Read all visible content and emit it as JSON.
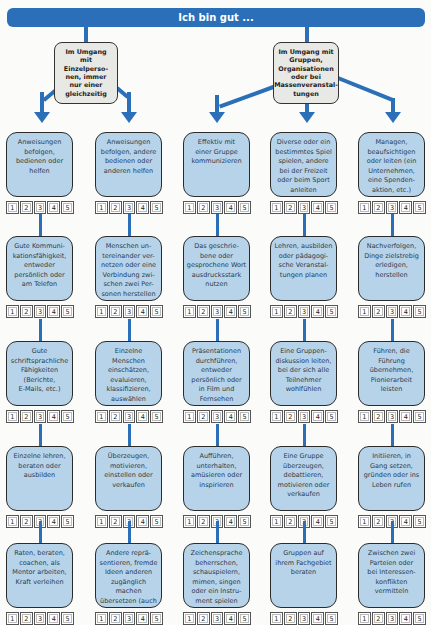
{
  "header": {
    "title": "Ich bin gut ..."
  },
  "groups": [
    {
      "label": "Im Umgang\nmit\nEinzelperso-\nnen, immer\nnur einer\ngleichzeitig"
    },
    {
      "label": "Im Umgang mit\nGruppen,\nOrganisationen\noder bei\nMassenveranstal-\ntungen"
    }
  ],
  "rating_scale": [
    "1",
    "2",
    "3",
    "4",
    "5"
  ],
  "colors": {
    "accent": "#2a6fb8",
    "box_fill": "#b7d3ea",
    "group_fill": "#e8e8e4"
  },
  "columns": [
    {
      "items": [
        "Anweisungen\nbefolgen,\nbedienen oder\nhelfen",
        "Gute Kommuni-\nkationsfähigkeit,\nentweder\npersönlich oder\nam Telefon",
        "Gute\nschriftsprachliche\nFähigkeiten\n(Berichte,\nE-Mails, etc.)",
        "Einzelne lehren,\nberaten oder\nausbilden",
        "Raten, beraten,\ncoachen, als\nMentor arbeiten,\nKraft verleihen"
      ]
    },
    {
      "items": [
        "Anweisungen\nbefolgen, andere\nbedienen oder\nanderen helfen",
        "Menschen un-\ntereinander ver-\nnetzen oder eine\nVerbindung zwi-\nschen zwei Per-\nsonen herstellen",
        "Einzelne\nMenschen\neinschätzen,\nevaluieren,\nklassifizieren,\nauswählen",
        "Überzeugen,\nmotivieren,\neinstellen oder\nverkaufen",
        "Andere reprä-\nsentieren, fremde\nIdeen anderen\nzugänglich machen\nübersetzen (auch\nSprachen)"
      ]
    },
    {
      "items": [
        "Effektiv mit\neiner Gruppe\nkommunizieren",
        "Das geschrie-\nbene oder\ngesprochene Wort\nausdrucksstark\nnutzen",
        "Präsentationen\ndurchführen,\nentweder\npersönlich oder\nin Film und\nFernsehen",
        "Aufführen,\nunterhalten,\namüsieren oder\ninspirieren",
        "Zeichensprache\nbeherrschen,\nschauspielern,\nmimen, singen\noder ein Instru-\nment spielen"
      ]
    },
    {
      "items": [
        "Diverse oder ein\nbestimmtes Spiel\nspielen, andere\nbei der Freizeit\noder beim Sport\nanleiten",
        "Lehren, ausbilden\noder pädagogi-\nsche Veranstal-\ntungen planen",
        "Eine Gruppen-\ndiskussion leiten,\nbei der sich alle\nTeilnehmer\nwohlfühlen",
        "Eine Gruppe\nüberzeugen,\ndebattieren,\nmotivieren oder\nverkaufen",
        "Gruppen auf\nihrem Fachgebiet\nberaten"
      ]
    },
    {
      "items": [
        "Managen,\nbeaufsichtigen\noder leiten (ein\nUnternehmen,\neine Spenden-\naktion, etc.)",
        "Nachverfolgen,\nDinge zielstrebig\nerledigen,\nherstellen",
        "Führen, die\nFührung\nübernehmen,\nPionierarbeit\nleisten",
        "Initiieren, in\nGang setzen,\ngründen oder ins\nLeben rufen",
        "Zwischen zwei\nParteien oder\nbei Interessen-\nkonflikten\nvermitteln"
      ]
    }
  ]
}
